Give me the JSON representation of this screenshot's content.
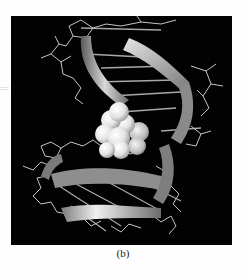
{
  "figure": {
    "caption": "(b)",
    "colors": {
      "background": "#020202",
      "page": "#fefefe",
      "ribbon": "#9a9a9a",
      "ribbon_highlight": "#e8e8e8",
      "sticks": "#bdbdbd",
      "spheres": "#f2f2f2"
    }
  }
}
